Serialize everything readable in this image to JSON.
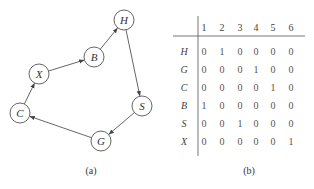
{
  "panel_a": {
    "caption": "(a)",
    "nodes": [
      {
        "id": "H",
        "label": "H",
        "x": 124,
        "y": 20
      },
      {
        "id": "B",
        "label": "B",
        "x": 94,
        "y": 57
      },
      {
        "id": "X",
        "label": "X",
        "x": 39,
        "y": 74
      },
      {
        "id": "C",
        "label": "C",
        "x": 20,
        "y": 113
      },
      {
        "id": "G",
        "label": "G",
        "x": 101,
        "y": 141
      },
      {
        "id": "S",
        "label": "S",
        "x": 142,
        "y": 106
      }
    ],
    "edges": [
      {
        "from": "C",
        "to": "X"
      },
      {
        "from": "X",
        "to": "B"
      },
      {
        "from": "B",
        "to": "H"
      },
      {
        "from": "H",
        "to": "S"
      },
      {
        "from": "S",
        "to": "G"
      },
      {
        "from": "G",
        "to": "C"
      }
    ]
  },
  "panel_b": {
    "caption": "(b)",
    "columns": [
      "1",
      "2",
      "3",
      "4",
      "5",
      "6"
    ],
    "rows": [
      {
        "label": "H",
        "values": [
          "0",
          "1",
          "0",
          "0",
          "0",
          "0"
        ]
      },
      {
        "label": "G",
        "values": [
          "0",
          "0",
          "0",
          "1",
          "0",
          "0"
        ]
      },
      {
        "label": "C",
        "values": [
          "0",
          "0",
          "0",
          "0",
          "1",
          "0"
        ]
      },
      {
        "label": "B",
        "values": [
          "1",
          "0",
          "0",
          "0",
          "0",
          "0"
        ]
      },
      {
        "label": "S",
        "values": [
          "0",
          "0",
          "1",
          "0",
          "0",
          "0"
        ]
      },
      {
        "label": "X",
        "values": [
          "0",
          "0",
          "0",
          "0",
          "0",
          "1"
        ]
      }
    ]
  }
}
